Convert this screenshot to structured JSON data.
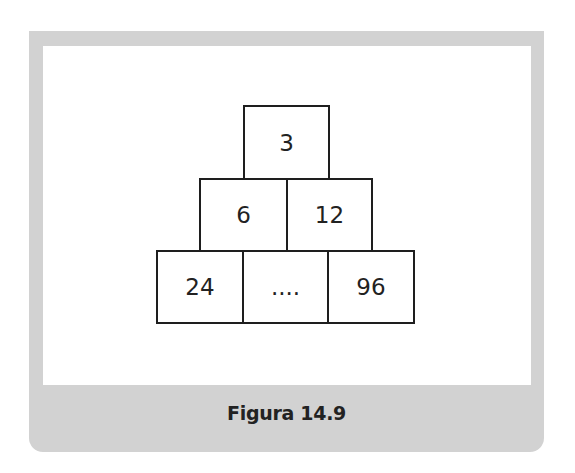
{
  "figure": {
    "caption": "Figura 14.9",
    "pyramid": {
      "rows": [
        [
          "3"
        ],
        [
          "6",
          "12"
        ],
        [
          "24",
          "....",
          "96"
        ]
      ]
    },
    "colors": {
      "frame": "#d2d2d2",
      "panel": "#ffffff",
      "stroke": "#1e1e1e"
    }
  }
}
